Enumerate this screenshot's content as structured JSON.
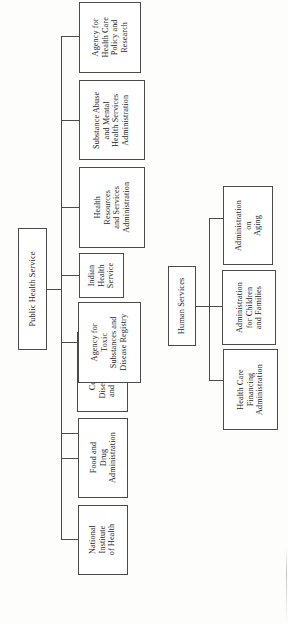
{
  "figure": {
    "type": "organization-chart",
    "orientation": "rotated-90-counterclockwise",
    "background_color": "#fdfdfc",
    "line_color": "#4a4a4a",
    "box_border_color": "#4a4a4a",
    "box_fill_color": "#ffffff"
  },
  "branches": [
    {
      "id": "public-health-service",
      "root": {
        "label": "Public Health Service"
      },
      "children": [
        {
          "id": "nih",
          "label": "National\nInstitute\nof Health"
        },
        {
          "id": "fda",
          "label": "Food and\nDrug\nAdministration"
        },
        {
          "id": "cdc",
          "label": "Centers for\nDisease Control\nand Prevention"
        },
        {
          "id": "atsdr",
          "label": "Agency for\nToxic\nSubstances and\nDisease Registry"
        },
        {
          "id": "ihs",
          "label": "Indian\nHealth\nService"
        },
        {
          "id": "hrsa",
          "label": "Health\nResources\nand Services\nAdministration"
        },
        {
          "id": "samhsa",
          "label": "Substance Abuse\nand Mental\nHealth Services\nAdministration"
        },
        {
          "id": "ahcpr",
          "label": "Agency for\nHealth Care\nPolicy and\nResearch"
        }
      ]
    },
    {
      "id": "human-services",
      "root": {
        "label": "Human Services"
      },
      "children": [
        {
          "id": "hcfa",
          "label": "Health Care\nFinancing\nAdministration"
        },
        {
          "id": "acf",
          "label": "Administration\nfor Children\nand Families"
        },
        {
          "id": "aoa",
          "label": "Administration\non\nAging"
        }
      ]
    }
  ]
}
